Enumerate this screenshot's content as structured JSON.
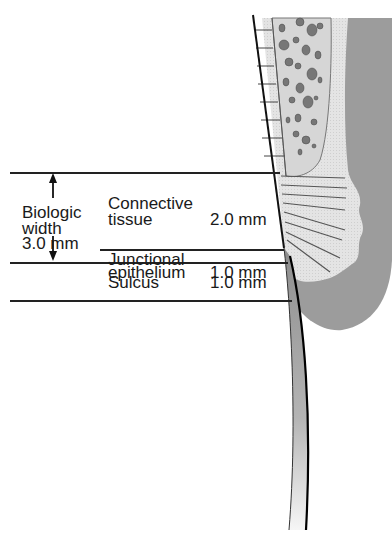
{
  "diagram": {
    "type": "anatomical-cross-section",
    "biologic_width": {
      "label_line1": "Biologic",
      "label_line2": "width",
      "label_line3": "3.0 mm"
    },
    "zones": [
      {
        "name_line1": "Connective",
        "name_line2": "tissue",
        "measure": "2.0 mm"
      },
      {
        "name_line1": "Junctional",
        "name_line2": "epithelium",
        "measure": "1.0 mm"
      },
      {
        "name_line1": "Sulcus",
        "name_line2": "",
        "measure": "1.0 mm"
      }
    ],
    "colors": {
      "line": "#222222",
      "bone_fill": "#d9d9d9",
      "soft_tissue_light": "#e6e6e6",
      "gingiva_dark": "#9a9a9a",
      "tooth_gradient_top": "#8c8c8c",
      "tooth_gradient_bottom": "#f4f4f4"
    }
  }
}
